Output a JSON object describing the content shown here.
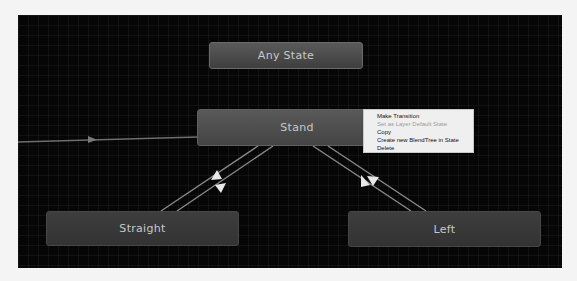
{
  "graph": {
    "nodes": [
      {
        "id": "any-state",
        "label": "Any State"
      },
      {
        "id": "stand",
        "label": "Stand"
      },
      {
        "id": "straight",
        "label": "Straight"
      },
      {
        "id": "left",
        "label": "Left"
      }
    ],
    "transitions": [
      {
        "from": "entry",
        "to": "Stand"
      },
      {
        "from": "Stand",
        "to": "Straight"
      },
      {
        "from": "Straight",
        "to": "Stand"
      },
      {
        "from": "Stand",
        "to": "Left"
      },
      {
        "from": "Left",
        "to": "Stand"
      }
    ]
  },
  "context_menu": {
    "items": [
      {
        "label": "Make Transition",
        "enabled": true
      },
      {
        "label": "Set as Layer Default State",
        "enabled": false
      },
      {
        "label": "Copy",
        "enabled": true
      },
      {
        "label": "Create new BlendTree in State",
        "enabled": true
      },
      {
        "label": "Delete",
        "enabled": true
      }
    ]
  },
  "colors": {
    "canvas_bg": "#060606",
    "node_bg": "#3d3d3d",
    "node_selected_bg": "#595959",
    "link": "#9a9a9a",
    "menu_bg": "#efefef"
  }
}
